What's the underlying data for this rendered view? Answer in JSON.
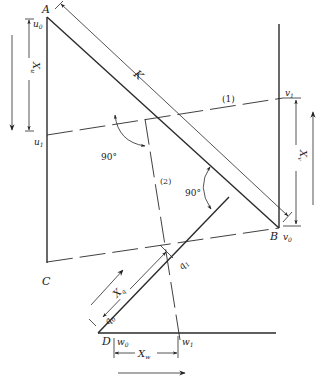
{
  "figure": {
    "points": {
      "A": "A",
      "B": "B",
      "C": "C",
      "D": "D"
    },
    "scale_marks": {
      "u0": "u",
      "u0_sub": "0",
      "u1": "u",
      "u1_sub": "1",
      "v0": "v",
      "v0_sub": "0",
      "v1": "v",
      "v1_sub": "1",
      "w0": "w",
      "w0_sub": "0",
      "w1": "w",
      "w1_sub": "1",
      "q0": "q",
      "q0_sub": "0",
      "q1": "q",
      "q1_sub": "1"
    },
    "dimensions": {
      "K": "K",
      "Xu": "X",
      "Xu_sub": "u",
      "Xv": "X",
      "Xv_sub": "v",
      "Xq": "X",
      "Xq_sub": "q",
      "Xw": "X",
      "Xw_sub": "w"
    },
    "index_lines": {
      "line1": "(1)",
      "line2": "(2)"
    },
    "angles": {
      "angle1": "90°",
      "angle2": "90°"
    },
    "direction_arrows": {
      "u_scale": "down",
      "v_scale": "up",
      "q_scale": "up-right",
      "w_scale": "right"
    }
  }
}
